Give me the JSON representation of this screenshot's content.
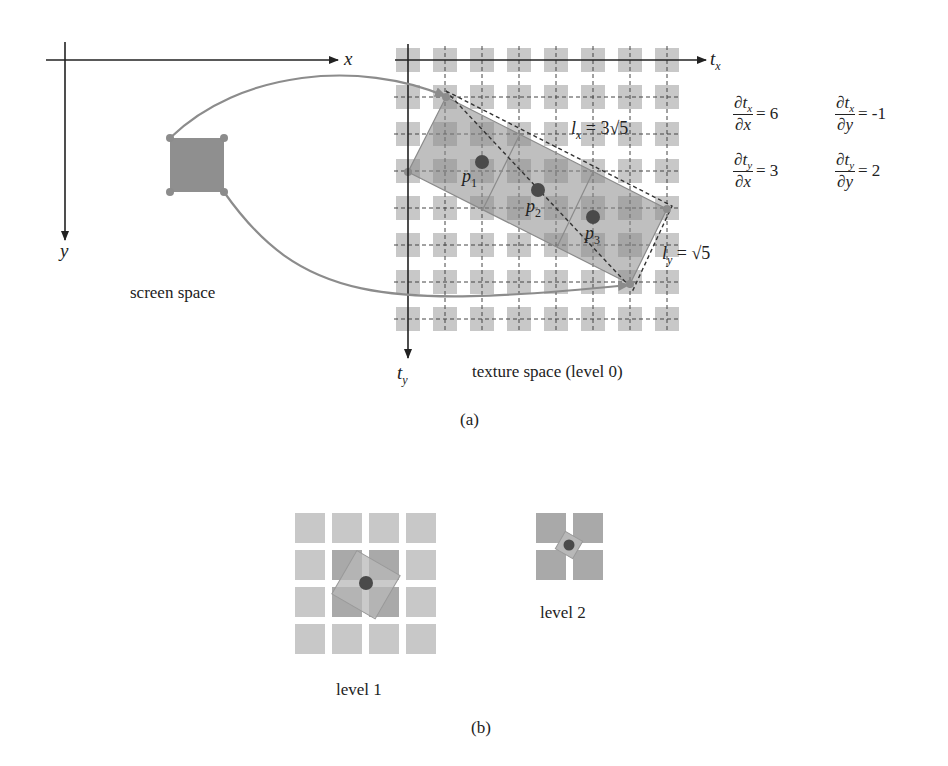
{
  "panel_a": {
    "caption": "(a)",
    "screen_space": {
      "label": "screen space",
      "x_axis": "x",
      "y_axis": "y"
    },
    "texture_space": {
      "label": "texture space (level 0)",
      "x_axis": "t",
      "x_axis_sub": "x",
      "y_axis": "t",
      "y_axis_sub": "y",
      "grid_size": 8,
      "points": [
        {
          "name": "p",
          "sub": "1"
        },
        {
          "name": "p",
          "sub": "2"
        },
        {
          "name": "p",
          "sub": "3"
        }
      ],
      "lx": {
        "lhs": "l",
        "sub": "x",
        "rhs": "= 3√5"
      },
      "ly": {
        "lhs": "l",
        "sub": "y",
        "rhs": "= √5"
      }
    },
    "derivatives": [
      {
        "num": "∂t",
        "num_sub": "x",
        "den": "∂x",
        "value": "= 6"
      },
      {
        "num": "∂t",
        "num_sub": "x",
        "den": "∂y",
        "value": "= -1"
      },
      {
        "num": "∂t",
        "num_sub": "y",
        "den": "∂x",
        "value": "= 3"
      },
      {
        "num": "∂t",
        "num_sub": "y",
        "den": "∂y",
        "value": "= 2"
      }
    ]
  },
  "panel_b": {
    "caption": "(b)",
    "level1_label": "level 1",
    "level2_label": "level 2"
  },
  "colors": {
    "cell": "#c8c8c8",
    "cell_dark": "#a9a9a9",
    "footprint": "#9a9a9a",
    "arrow": "#8c8c8c",
    "dot": "#4a4a4a",
    "axis": "#222222"
  }
}
